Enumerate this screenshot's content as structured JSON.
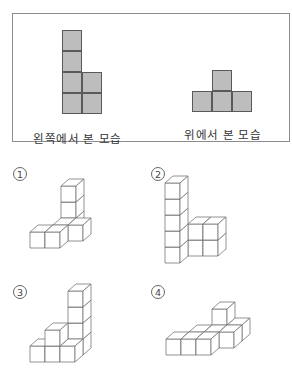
{
  "views": {
    "left_view": {
      "caption": "왼쪽에서 본 모습",
      "tiles": [
        [
          0,
          0
        ],
        [
          0,
          1
        ],
        [
          0,
          2
        ],
        [
          1,
          2
        ],
        [
          0,
          3
        ],
        [
          1,
          3
        ]
      ]
    },
    "top_view": {
      "caption": "위에서 본 모습",
      "tiles": [
        [
          1,
          0
        ],
        [
          0,
          1
        ],
        [
          1,
          1
        ],
        [
          2,
          1
        ]
      ]
    }
  },
  "choices": [
    {
      "label": "①",
      "num": "1",
      "cubes": [
        [
          0,
          0,
          0
        ],
        [
          1,
          0,
          0
        ],
        [
          1,
          1,
          0
        ],
        [
          2,
          1,
          0
        ],
        [
          1,
          2,
          0
        ],
        [
          1,
          2,
          1
        ],
        [
          1,
          2,
          2
        ]
      ]
    },
    {
      "label": "②",
      "num": "2",
      "cubes": [
        [
          0,
          0,
          0
        ],
        [
          0,
          0,
          1
        ],
        [
          0,
          0,
          2
        ],
        [
          0,
          0,
          3
        ],
        [
          0,
          0,
          4
        ],
        [
          1,
          1,
          0
        ],
        [
          1,
          1,
          1
        ],
        [
          2,
          1,
          0
        ],
        [
          2,
          1,
          1
        ]
      ]
    },
    {
      "label": "③",
      "num": "3",
      "cubes": [
        [
          0,
          0,
          0
        ],
        [
          1,
          0,
          0
        ],
        [
          1,
          0,
          1
        ],
        [
          2,
          0,
          0
        ],
        [
          2,
          1,
          0
        ],
        [
          2,
          1,
          1
        ],
        [
          2,
          1,
          2
        ],
        [
          2,
          1,
          3
        ]
      ]
    },
    {
      "label": "④",
      "num": "4",
      "cubes": [
        [
          0,
          0,
          0
        ],
        [
          1,
          0,
          0
        ],
        [
          2,
          0,
          0
        ],
        [
          1,
          1,
          0
        ],
        [
          2,
          1,
          0
        ],
        [
          3,
          1,
          0
        ],
        [
          3,
          2,
          0
        ],
        [
          2,
          2,
          1
        ]
      ]
    }
  ]
}
